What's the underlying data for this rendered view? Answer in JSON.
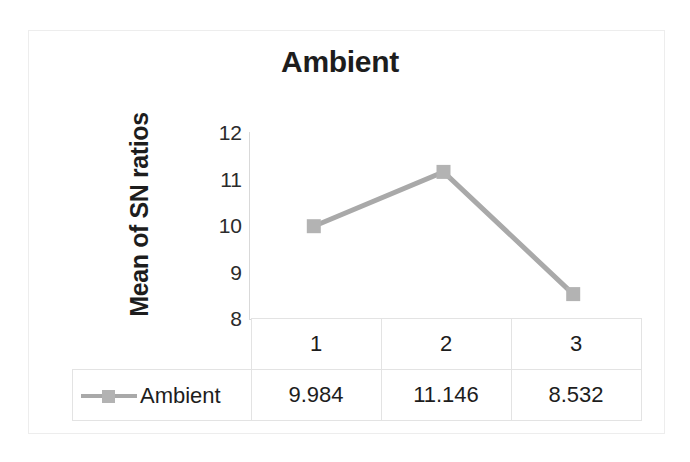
{
  "chart_data": {
    "type": "line",
    "title": "Ambient",
    "xlabel": "",
    "ylabel": "Mean of SN ratios",
    "categories": [
      "1",
      "2",
      "3"
    ],
    "series": [
      {
        "name": "Ambient",
        "values": [
          9.984,
          11.146,
          8.532
        ],
        "display_values": [
          "9.984",
          "11.146",
          "8.532"
        ],
        "color": "#a9a9a9",
        "marker": "square"
      }
    ],
    "ylim": [
      8,
      12
    ],
    "yticks": [
      12,
      11,
      10,
      9,
      8
    ],
    "ytick_labels": [
      "12",
      "11",
      "10",
      "9",
      "8"
    ],
    "grid": false,
    "legend_position": "data-table-row",
    "data_table_visible": true
  },
  "table": {
    "header_row": [
      "1",
      "2",
      "3"
    ],
    "series_label": "Ambient",
    "value_row": [
      "9.984",
      "11.146",
      "8.532"
    ]
  },
  "colors": {
    "series": "#a9a9a9",
    "marker": "#b3b3b3",
    "axis": "#d9d9d9",
    "table_border": "#e3e3e3",
    "frame_border": "#ededed",
    "text": "#1d1d1d"
  }
}
